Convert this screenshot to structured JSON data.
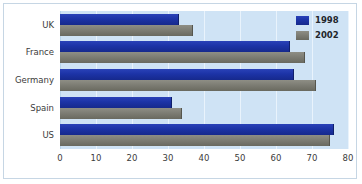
{
  "chart_data": {
    "type": "bar",
    "orientation": "horizontal",
    "title": "",
    "xlabel": "",
    "ylabel": "",
    "xlim": [
      0,
      80
    ],
    "xticks": [
      0,
      10,
      20,
      30,
      40,
      50,
      60,
      70,
      80
    ],
    "grid": true,
    "legend_position": "top-right",
    "categories": [
      "UK",
      "France",
      "Germany",
      "Spain",
      "US"
    ],
    "series": [
      {
        "name": "1998",
        "color": "#1c33a6",
        "values": [
          33,
          64,
          65,
          31,
          76
        ]
      },
      {
        "name": "2002",
        "color": "#7d7d74",
        "values": [
          37,
          68,
          71,
          34,
          75
        ]
      }
    ],
    "plot_background": "#cfe3f5",
    "frame_color": "#c6d6e4"
  },
  "legend": {
    "items": [
      {
        "label": "1998"
      },
      {
        "label": "2002"
      }
    ]
  }
}
